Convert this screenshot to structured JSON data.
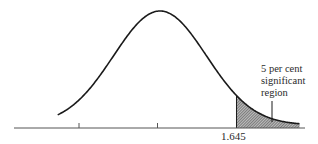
{
  "chart_data": {
    "type": "area",
    "title": "",
    "xlabel": "",
    "ylabel": "",
    "x_ticks": [
      {
        "value": -1.645,
        "label": ""
      },
      {
        "value": 0,
        "label": ""
      },
      {
        "value": 1.645,
        "label": "1.645"
      }
    ],
    "xlim": [
      -3.0,
      3.0
    ],
    "curve": "normal pdf, mean 0, sd 1",
    "shaded_region": {
      "from": 1.645,
      "to": 3.0,
      "area_percent": 5
    },
    "annotation": {
      "lines": [
        "5 per cent",
        "significant",
        "region"
      ]
    },
    "grid": false,
    "legend": null
  },
  "labels": {
    "critical_value": "1.645",
    "annotation_line1": "5 per cent",
    "annotation_line2": "significant",
    "annotation_line3": "region"
  },
  "colors": {
    "curve": "#1a1a1a",
    "axis": "#555555",
    "hatch": "#444444",
    "background": "#ffffff"
  }
}
